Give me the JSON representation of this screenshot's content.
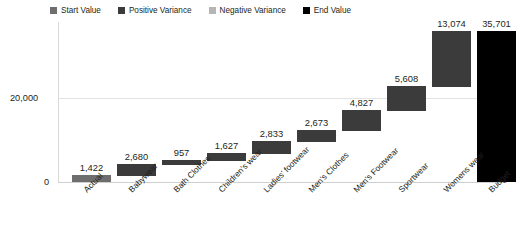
{
  "legend": {
    "items": [
      {
        "label": "Start Value",
        "color": "#6e6e6e"
      },
      {
        "label": "Positive Variance",
        "color": "#3b3b3b"
      },
      {
        "label": "Negative Variance",
        "color": "#b5b5b5"
      },
      {
        "label": "End Value",
        "color": "#000000"
      }
    ]
  },
  "axis": {
    "y_ticks": [
      "20,000",
      "0"
    ],
    "y_tick_20000": "20,000",
    "y_tick_0": "0"
  },
  "chart_data": {
    "type": "bar",
    "chart_subtype": "waterfall",
    "title": "",
    "subtitle": "",
    "xlabel": "",
    "ylabel": "",
    "ylim": [
      0,
      40000
    ],
    "grid": true,
    "legend_position": "top-left",
    "categories": [
      "Actual",
      "Babywear",
      "Bath Clothes",
      "Children's wear",
      "Ladies' footwear",
      "Men's Clothes",
      "Men's Footwear",
      "Sportwear",
      "Womens wear",
      "Budget"
    ],
    "values": [
      1422,
      2680,
      957,
      1627,
      2833,
      2673,
      4827,
      5608,
      13074,
      35701
    ],
    "value_labels": [
      "1,422",
      "2,680",
      "957",
      "1,627",
      "2,833",
      "2,673",
      "4,827",
      "5,608",
      "13,074",
      "35,701"
    ],
    "bar_types": [
      "start",
      "positive",
      "positive",
      "positive",
      "positive",
      "positive",
      "positive",
      "positive",
      "positive",
      "end"
    ],
    "cumulative_start": [
      0,
      1422,
      4102,
      5059,
      6686,
      9519,
      12192,
      17019,
      22627,
      0
    ],
    "cumulative_end": [
      1422,
      4102,
      5059,
      6686,
      9519,
      12192,
      17019,
      22627,
      35701,
      35701
    ],
    "axis_ticks": [
      0,
      20000
    ],
    "axis_tick_labels": [
      "0",
      "20,000"
    ]
  },
  "bars": [
    {
      "label": "Actual",
      "value_label": "1,422",
      "color": "#6e6e6e",
      "left": 14,
      "width": 39,
      "top": 153,
      "height": 7
    },
    {
      "label": "Babywear",
      "value_label": "2,680",
      "color": "#3b3b3b",
      "left": 59,
      "width": 39,
      "top": 142,
      "height": 12
    },
    {
      "label": "Bath Clothes",
      "value_label": "957",
      "color": "#3b3b3b",
      "left": 104,
      "width": 39,
      "top": 138,
      "height": 5
    },
    {
      "label": "Children's wear",
      "value_label": "1,627",
      "color": "#3b3b3b",
      "left": 149,
      "width": 39,
      "top": 131,
      "height": 8
    },
    {
      "label": "Ladies' footwear",
      "value_label": "2,833",
      "color": "#3b3b3b",
      "left": 194,
      "width": 39,
      "top": 119,
      "height": 13
    },
    {
      "label": "Men's Clothes",
      "value_label": "2,673",
      "color": "#3b3b3b",
      "left": 239,
      "width": 39,
      "top": 108,
      "height": 12
    },
    {
      "label": "Men's Footwear",
      "value_label": "4,827",
      "color": "#3b3b3b",
      "left": 284,
      "width": 39,
      "top": 88,
      "height": 21
    },
    {
      "label": "Sportwear",
      "value_label": "5,608",
      "color": "#3b3b3b",
      "left": 329,
      "width": 39,
      "top": 64,
      "height": 25
    },
    {
      "label": "Womens wear",
      "value_label": "13,074",
      "color": "#3b3b3b",
      "left": 374,
      "width": 39,
      "top": 9,
      "height": 56
    },
    {
      "label": "Budget",
      "value_label": "35,701",
      "color": "#000000",
      "left": 419,
      "width": 39,
      "top": 9,
      "height": 151
    }
  ]
}
